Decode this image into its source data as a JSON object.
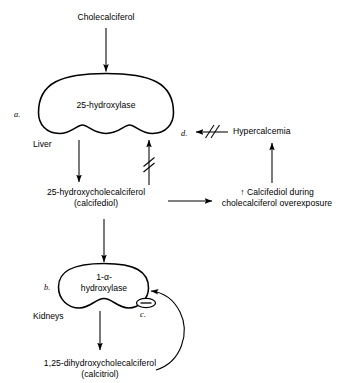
{
  "diagram": {
    "stroke_color": "#000000",
    "background_color": "#ffffff",
    "nodes": {
      "substrate": "Cholecalciferol",
      "liver_enzyme": "25-hydroxylase",
      "liver_organ": "Liver",
      "intermediate_line1": "25-hydroxycholecalciferol",
      "intermediate_line2": "(calcifediol)",
      "kidney_enzyme_line1": "1-α-",
      "kidney_enzyme_line2": "hydroxylase",
      "kidney_organ": "Kidneys",
      "product_line1": "1,25-dihydroxycholecalciferol",
      "product_line2": "(calcitriol)",
      "overexposure_line1": "↑ Calcifediol during",
      "overexposure_line2": "cholecalciferol overexposure",
      "hypercalcemia": "Hypercalcemia"
    },
    "markers": {
      "a": "a.",
      "b": "b.",
      "c": "c.",
      "d": "d."
    },
    "icons": {
      "minus_feedback": "negative-feedback-icon",
      "inhibition_slash": "inhibition-slash-icon",
      "arrowhead": "arrowhead-icon"
    }
  }
}
